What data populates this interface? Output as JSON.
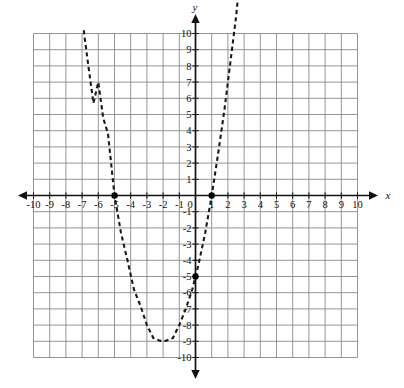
{
  "chart_data": {
    "type": "line",
    "title": "",
    "subtitle": "",
    "xlabel": "x",
    "ylabel": "y",
    "xlim": [
      -10,
      10
    ],
    "ylim": [
      -10,
      10
    ],
    "grid": true,
    "legend_position": "none",
    "x_tick_labels": [
      "-10",
      "-9",
      "-8",
      "-7",
      "-6",
      "-5",
      "-4",
      "-3",
      "-2",
      "-1",
      "0",
      "1",
      "2",
      "3",
      "4",
      "5",
      "6",
      "7",
      "8",
      "9",
      "10"
    ],
    "y_tick_labels": [
      "10",
      "9",
      "8",
      "7",
      "6",
      "5",
      "4",
      "3",
      "2",
      "1",
      "0",
      "-1",
      "-2",
      "-3",
      "-4",
      "-5",
      "-6",
      "-7",
      "-8",
      "-9",
      "-10"
    ],
    "x_tick_values": [
      -10,
      -9,
      -8,
      -7,
      -6,
      -5,
      -4,
      -3,
      -2,
      -1,
      0,
      1,
      2,
      3,
      4,
      5,
      6,
      7,
      8,
      9,
      10
    ],
    "y_tick_values": [
      10,
      9,
      8,
      7,
      6,
      5,
      4,
      3,
      2,
      1,
      0,
      -1,
      -2,
      -3,
      -4,
      -5,
      -6,
      -7,
      -8,
      -9,
      -10
    ],
    "series": [
      {
        "name": "parabola",
        "style": "dashed",
        "color": "#1a1a1a",
        "equation": "y = x^2 + 4x - 5",
        "vertex": [
          -2,
          -9
        ],
        "x_intercepts": [
          -5,
          1
        ],
        "y_intercept": -5,
        "x": [
          -6.9,
          -6.6,
          -6.3,
          -6.0,
          -5.7,
          -5.4,
          -5.0,
          -4.6,
          -4.2,
          -3.8,
          -3.4,
          -3.0,
          -2.6,
          -2.2,
          -2.0,
          -1.8,
          -1.4,
          -1.0,
          -0.6,
          -0.2,
          0.2,
          0.6,
          1.0,
          1.4,
          1.8,
          2.2,
          2.5,
          2.7
        ],
        "y": [
          10.2,
          7.9,
          5.7,
          7.0,
          4.8,
          3.8,
          0.0,
          -2.3,
          -4.0,
          -5.8,
          -6.8,
          -8.0,
          -8.8,
          -8.96,
          -9.0,
          -8.96,
          -8.8,
          -8.0,
          -7.0,
          -5.8,
          -4.2,
          -2.3,
          0.0,
          2.6,
          5.4,
          8.6,
          11.0,
          13.0
        ]
      }
    ],
    "marked_points": [
      {
        "label": "left x-intercept",
        "x": -5,
        "y": 0
      },
      {
        "label": "right x-intercept",
        "x": 1,
        "y": 0
      },
      {
        "label": "y-intercept",
        "x": 0,
        "y": -5
      }
    ]
  },
  "colors": {
    "grid": "#8a8a8a",
    "axis": "#111111",
    "curve": "#1a1a1a",
    "background": "#ffffff",
    "point": "#000000"
  }
}
